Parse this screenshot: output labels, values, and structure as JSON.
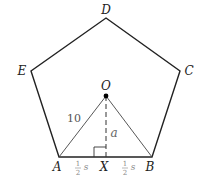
{
  "diagram": {
    "type": "regular-pentagon-apothem",
    "vertices": {
      "A": "A",
      "B": "B",
      "C": "C",
      "D": "D",
      "E": "E"
    },
    "center": "O",
    "foot": "X",
    "radius_label": "10",
    "apothem_label": "a",
    "half_side_left": {
      "num": "1",
      "den": "2",
      "var": "s"
    },
    "half_side_right": {
      "num": "1",
      "den": "2",
      "var": "s"
    },
    "colors": {
      "stroke": "#222222",
      "thin_stroke": "#444444",
      "label": "#222222",
      "muted_label": "#888888"
    }
  }
}
